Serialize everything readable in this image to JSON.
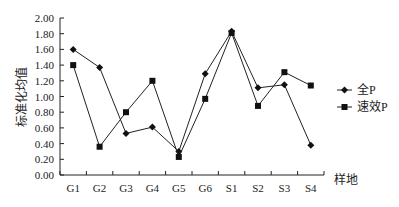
{
  "chart_data": {
    "type": "line",
    "title": "",
    "xlabel": "样地",
    "ylabel": "标准化均值",
    "categories": [
      "G1",
      "G2",
      "G3",
      "G4",
      "G5",
      "G6",
      "S1",
      "S2",
      "S3",
      "S4"
    ],
    "series": [
      {
        "name": "全P",
        "marker": "diamond",
        "values": [
          1.6,
          1.37,
          0.53,
          0.61,
          0.3,
          1.29,
          1.83,
          1.11,
          1.15,
          0.38
        ]
      },
      {
        "name": "速效P",
        "marker": "square",
        "values": [
          1.4,
          0.36,
          0.8,
          1.2,
          0.23,
          0.97,
          1.81,
          0.88,
          1.31,
          1.14
        ]
      }
    ],
    "ylim": [
      0,
      2.0
    ],
    "yticks": [
      "0.00",
      "0.20",
      "0.40",
      "0.60",
      "0.80",
      "1.00",
      "1.20",
      "1.40",
      "1.60",
      "1.80",
      "2.00"
    ],
    "grid": false,
    "legend_position": "right"
  }
}
